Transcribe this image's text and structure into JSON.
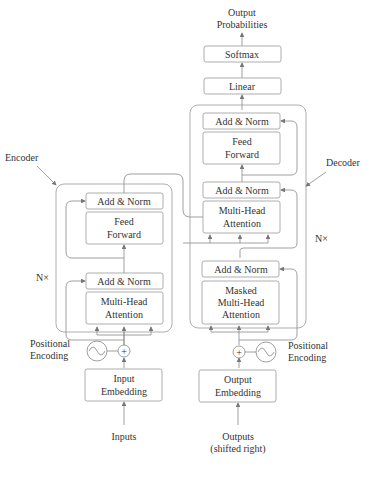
{
  "output_label": [
    "Output",
    "Probabilities"
  ],
  "softmax": "Softmax",
  "linear": "Linear",
  "encoder": {
    "label": "Encoder",
    "repeat": "N×",
    "add_norm_top": "Add & Norm",
    "feed_forward": [
      "Feed",
      "Forward"
    ],
    "add_norm_bottom": "Add & Norm",
    "attention": [
      "Multi-Head",
      "Attention"
    ],
    "positional_encoding": [
      "Positional",
      "Encoding"
    ],
    "embedding": [
      "Input",
      "Embedding"
    ],
    "input": "Inputs"
  },
  "decoder": {
    "label": "Decoder",
    "repeat": "N×",
    "add_norm_top": "Add & Norm",
    "feed_forward": [
      "Feed",
      "Forward"
    ],
    "add_norm_mid": "Add & Norm",
    "attention": [
      "Multi-Head",
      "Attention"
    ],
    "add_norm_bottom": "Add & Norm",
    "masked_attention": [
      "Masked",
      "Multi-Head",
      "Attention"
    ],
    "positional_encoding": [
      "Positional",
      "Encoding"
    ],
    "embedding": [
      "Output",
      "Embedding"
    ],
    "input": [
      "Outputs",
      "(shifted right)"
    ]
  }
}
